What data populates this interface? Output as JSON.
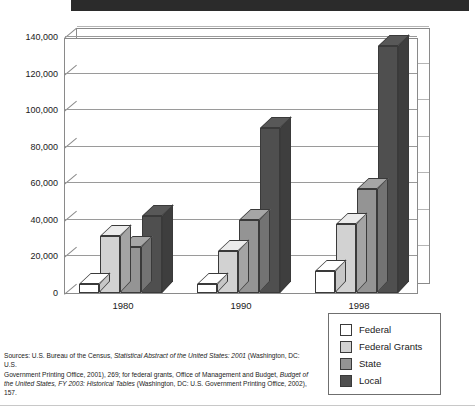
{
  "chart_data": {
    "type": "bar",
    "title": "",
    "subtitle": "",
    "xlabel": "",
    "ylabel": "",
    "categories": [
      "1980",
      "1990",
      "1998"
    ],
    "series": [
      {
        "name": "Federal",
        "values": [
          5000,
          5000,
          12000
        ],
        "color": "#ffffff"
      },
      {
        "name": "Federal Grants",
        "values": [
          31000,
          23000,
          38000
        ],
        "color": "#d2d2d2"
      },
      {
        "name": "State",
        "values": [
          25000,
          40000,
          57000
        ],
        "color": "#949494"
      },
      {
        "name": "Local",
        "values": [
          42000,
          90000,
          135000
        ],
        "color": "#4f4f4f"
      }
    ],
    "ylim": [
      0,
      140000
    ],
    "yticks": [
      "0",
      "20,000",
      "40,000",
      "60,000",
      "80,000",
      "100,000",
      "120,000",
      "140,000"
    ],
    "ytick_values": [
      0,
      20000,
      40000,
      60000,
      80000,
      100000,
      120000,
      140000
    ],
    "grid": true,
    "legend_position": "bottom-right",
    "style": "3d-column"
  },
  "legend": {
    "items": [
      {
        "label": "Federal",
        "color": "#ffffff"
      },
      {
        "label": "Federal Grants",
        "color": "#d2d2d2"
      },
      {
        "label": "State",
        "color": "#949494"
      },
      {
        "label": "Local",
        "color": "#4f4f4f"
      }
    ]
  },
  "source": {
    "line1_a": "Sources: U.S. Bureau of the Census, ",
    "line1_i": "Statistical Abstract of the United States: 2001",
    "line1_b": " (Washington, DC: U.S.",
    "line2_a": "Government Printing Office, 2001), 269; for federal grants, Office of Management and Budget, ",
    "line2_i": "Budget of",
    "line3_i": "the United States, FY 2003: Historical Tables",
    "line3_b": " (Washington, DC: U.S. Government Printing Office, 2002), 157."
  }
}
